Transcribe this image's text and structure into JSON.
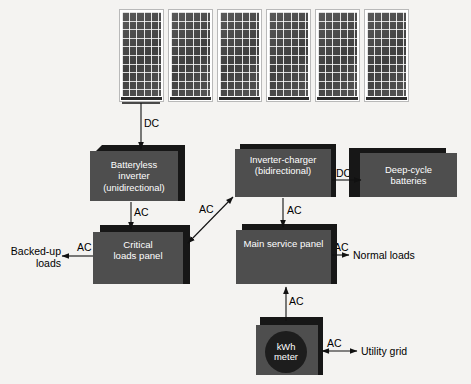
{
  "diagram": {
    "background_color": "#f4f3f1",
    "box_fill_color": "#4e4e4e",
    "box_shadow_color": "#171717",
    "text_color_on_box": "#ffffff",
    "text_color_on_page": "#000000"
  },
  "array": {
    "name": "pv-array",
    "panel_count": 6,
    "panel_label": "solar-panel"
  },
  "nodes": [
    {
      "id": "batteryless-inverter",
      "lines": [
        "Batteryless",
        "inverter",
        "(unidirectional)"
      ],
      "text": "Batteryless inverter (unidirectional)"
    },
    {
      "id": "inverter-charger",
      "lines": [
        "Inverter-charger",
        "(bidirectional)"
      ],
      "text": "Inverter-charger (bidirectional)"
    },
    {
      "id": "deep-cycle-batteries",
      "lines": [
        "Deep-cycle",
        "batteries"
      ],
      "text": "Deep-cycle batteries"
    },
    {
      "id": "critical-loads-panel",
      "lines": [
        "Critical",
        "loads panel"
      ],
      "text": "Critical loads panel"
    },
    {
      "id": "main-service-panel",
      "lines": [
        "Main service panel"
      ],
      "text": "Main service panel"
    },
    {
      "id": "kwh-meter",
      "lines": [
        "kWh",
        "meter"
      ],
      "text": "kWh meter"
    }
  ],
  "external_labels": [
    {
      "id": "backed-up-loads",
      "lines": [
        "Backed-up",
        "loads"
      ],
      "text": "Backed-up loads"
    },
    {
      "id": "normal-loads",
      "lines": [
        "Normal loads"
      ],
      "text": "Normal loads"
    },
    {
      "id": "utility-grid",
      "lines": [
        "Utility grid"
      ],
      "text": "Utility grid"
    }
  ],
  "edges": [
    {
      "id": "array-to-batteryless-inverter",
      "label": "DC",
      "direction": "down"
    },
    {
      "id": "batteryless-inverter-to-critical-loads",
      "label": "AC",
      "direction": "down"
    },
    {
      "id": "critical-loads-to-backed-up-loads",
      "label": "AC",
      "direction": "left"
    },
    {
      "id": "inverter-charger-to-critical-loads",
      "label": "AC",
      "direction": "bidirectional"
    },
    {
      "id": "inverter-charger-to-batteries",
      "label": "DC",
      "direction": "right"
    },
    {
      "id": "inverter-charger-to-main-panel",
      "label": "AC",
      "direction": "down"
    },
    {
      "id": "main-panel-to-normal-loads",
      "label": "AC",
      "direction": "right"
    },
    {
      "id": "kwh-meter-to-main-panel",
      "label": "AC",
      "direction": "up"
    },
    {
      "id": "kwh-meter-to-utility-grid",
      "label": "AC",
      "direction": "bidirectional"
    }
  ],
  "edge_labels": {
    "dc_array": "DC",
    "ac_inverter_critical": "AC",
    "ac_backed_up": "AC",
    "ac_diagonal": "AC",
    "dc_batteries": "DC",
    "ac_charger_main": "AC",
    "ac_normal": "AC",
    "ac_meter_main": "AC",
    "ac_utility": "AC"
  }
}
